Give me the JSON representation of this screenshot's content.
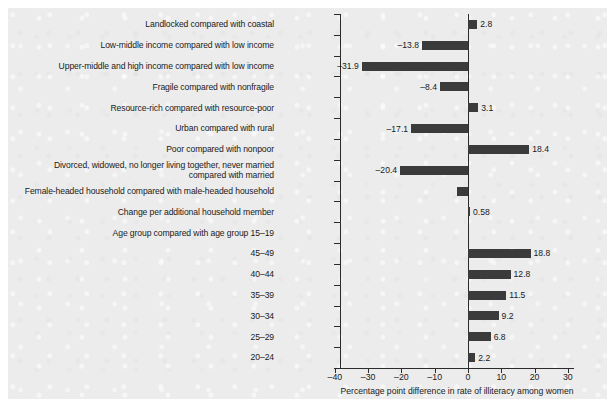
{
  "chart_data": {
    "type": "bar",
    "orientation": "horizontal",
    "title": "",
    "xlabel": "Percentage point difference in rate of illiteracy among women",
    "ylabel": "",
    "xlim": [
      -40,
      30
    ],
    "xticks": [
      -40,
      -30,
      -20,
      -10,
      0,
      10,
      20,
      30
    ],
    "xticklabels": [
      "–40",
      "–30",
      "–20",
      "–10",
      "0",
      "10",
      "20",
      "30"
    ],
    "grid": false,
    "legend": null,
    "bar_color": "#3b3b3b",
    "background_color": "#ececec",
    "categories": [
      "Landlocked compared with coastal",
      "Low-middle income compared with low income",
      "Upper-middle and high income compared with low income",
      "Fragile compared with nonfragile",
      "Resource-rich compared with resource-poor",
      "Urban compared with rural",
      "Poor compared with nonpoor",
      "Divorced, widowed, no longer living together, never married\ncompared with married",
      "Female-headed household compared with male-headed household",
      "Change per additional household member",
      "Age group compared with age group 15–19",
      "45–49",
      "40–44",
      "35–39",
      "30–34",
      "25–29",
      "20–24"
    ],
    "values": [
      2.8,
      -13.8,
      -31.9,
      -8.4,
      3.1,
      -17.1,
      18.4,
      -20.4,
      -3.2,
      0.58,
      null,
      18.8,
      12.8,
      11.5,
      9.2,
      6.8,
      2.2
    ],
    "value_labels": [
      "2.8",
      "–13.8",
      "–31.9",
      "–8.4",
      "3.1",
      "–17.1",
      "18.4",
      "–20.4",
      "",
      "0.58",
      "",
      "18.8",
      "12.8",
      "11.5",
      "9.2",
      "6.8",
      "2.2"
    ]
  }
}
